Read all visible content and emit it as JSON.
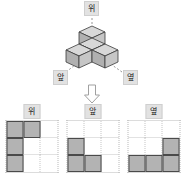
{
  "figure": {
    "name": "isometric-cube-solid",
    "cube_count": 4,
    "labels": {
      "top": "위",
      "front": "앞",
      "side": "옆"
    },
    "colors": {
      "cube_top_face": "#d8d8d8",
      "cube_left_face": "#b0b0b0",
      "cube_right_face": "#c4c4c4",
      "cube_outline": "#3a3a3a",
      "leader_line": "#8a8a8a"
    }
  },
  "arrow": {
    "name": "down-arrow",
    "direction": "down",
    "fill": "#ffffff",
    "stroke": "#9a9a9a"
  },
  "views": [
    {
      "key": "top",
      "label": "위",
      "rows": 3,
      "cols": 3,
      "filled": [
        [
          true,
          true,
          false
        ],
        [
          true,
          false,
          false
        ],
        [
          true,
          false,
          false
        ]
      ]
    },
    {
      "key": "front",
      "label": "앞",
      "rows": 3,
      "cols": 3,
      "filled": [
        [
          false,
          false,
          false
        ],
        [
          true,
          false,
          false
        ],
        [
          true,
          true,
          false
        ]
      ]
    },
    {
      "key": "side",
      "label": "옆",
      "rows": 3,
      "cols": 3,
      "filled": [
        [
          false,
          false,
          false
        ],
        [
          false,
          false,
          true
        ],
        [
          true,
          true,
          true
        ]
      ]
    }
  ],
  "grid_style": {
    "filled_color": "#b3b3b3",
    "filled_border": "#4a4a4a",
    "gridline_color": "#c4c4c4"
  }
}
